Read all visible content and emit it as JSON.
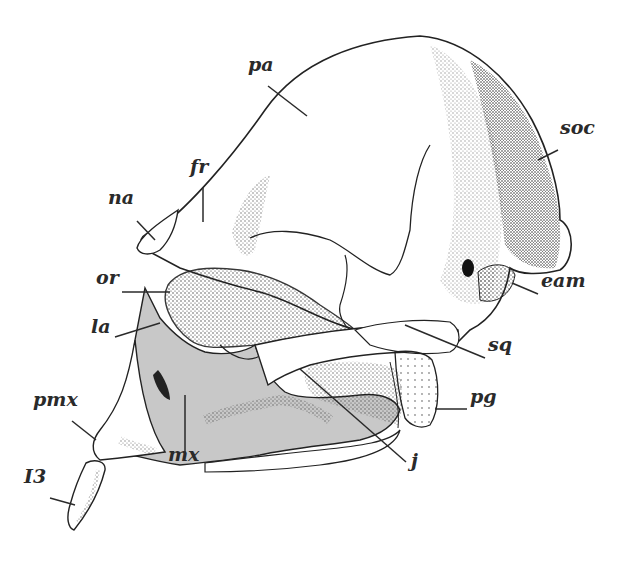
{
  "figure": {
    "shaded_region_color": "#c8c8c8",
    "line_color": "#222222",
    "labels": [
      {
        "id": "pa",
        "text": "pa",
        "x": 248,
        "y": 70
      },
      {
        "id": "fr",
        "text": "fr",
        "x": 190,
        "y": 172
      },
      {
        "id": "na",
        "text": "na",
        "x": 108,
        "y": 203
      },
      {
        "id": "soc",
        "text": "soc",
        "x": 560,
        "y": 133
      },
      {
        "id": "or",
        "text": "or",
        "x": 96,
        "y": 283
      },
      {
        "id": "la",
        "text": "la",
        "x": 91,
        "y": 332
      },
      {
        "id": "eam",
        "text": "eam",
        "x": 541,
        "y": 286
      },
      {
        "id": "sq",
        "text": "sq",
        "x": 488,
        "y": 350
      },
      {
        "id": "pg",
        "text": "pg",
        "x": 470,
        "y": 402
      },
      {
        "id": "pmx",
        "text": "pmx",
        "x": 33,
        "y": 405
      },
      {
        "id": "mx",
        "text": "mx",
        "x": 168,
        "y": 460
      },
      {
        "id": "j",
        "text": "j",
        "x": 411,
        "y": 466
      },
      {
        "id": "I3",
        "text": "I3",
        "x": 24,
        "y": 482
      }
    ]
  }
}
